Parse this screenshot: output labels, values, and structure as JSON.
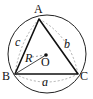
{
  "diagram": {
    "vertices": {
      "A": "A",
      "B": "B",
      "C": "C"
    },
    "center": "O",
    "radius_label": "R",
    "side_labels": {
      "a": "a",
      "b": "b",
      "c": "c"
    },
    "colors": {
      "stroke": "#111111",
      "dashed": "#888888",
      "background": "#ffffff"
    }
  }
}
